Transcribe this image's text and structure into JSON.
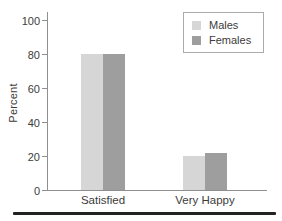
{
  "chart_data": {
    "type": "bar",
    "title": "",
    "categories": [
      "Satisfied",
      "Very Happy"
    ],
    "series": [
      {
        "name": "Males",
        "color": "#d6d6d6",
        "values": [
          80,
          20
        ]
      },
      {
        "name": "Females",
        "color": "#9e9e9e",
        "values": [
          80,
          22
        ]
      }
    ],
    "xlabel": "",
    "ylabel": "Percent",
    "ylim": [
      0,
      100
    ],
    "yticks": [
      0,
      20,
      40,
      60,
      80,
      100
    ],
    "grid": false,
    "legend": {
      "position": "top-right",
      "entries": [
        "Males",
        "Females"
      ]
    }
  },
  "colors": {
    "background": "#ffffff",
    "axis": "#8f8f8f",
    "text": "#3c3c3c",
    "legend_border": "#ababab",
    "bottom_rule": "#222222"
  }
}
